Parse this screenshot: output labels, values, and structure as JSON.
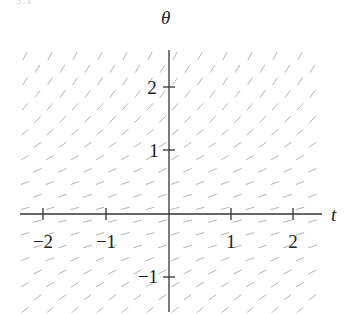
{
  "page_fragment": "3.1",
  "diagram": {
    "type": "slope_field",
    "x_axis": {
      "label": "t",
      "ticks": [
        -2,
        -1,
        1,
        2
      ],
      "tick_labels": [
        "−2",
        "−1",
        "1",
        "2"
      ],
      "range": [
        -2.35,
        2.4
      ]
    },
    "y_axis": {
      "label": "θ",
      "ticks": [
        2,
        1,
        -1
      ],
      "tick_labels": [
        "2",
        "1",
        "−1"
      ],
      "range": [
        -1.5,
        2.6
      ]
    },
    "slope_segment_color": "#b4b4b4",
    "axis_color": "#333333",
    "slope_profile": [
      {
        "theta": 2.5,
        "slope_angle_deg": 62
      },
      {
        "theta": 2.0,
        "slope_angle_deg": 55
      },
      {
        "theta": 1.5,
        "slope_angle_deg": 45
      },
      {
        "theta": 1.0,
        "slope_angle_deg": 32
      },
      {
        "theta": 0.5,
        "slope_angle_deg": 20
      },
      {
        "theta": 0.0,
        "slope_angle_deg": 14
      },
      {
        "theta": -0.5,
        "slope_angle_deg": 18
      },
      {
        "theta": -1.0,
        "slope_angle_deg": 28
      },
      {
        "theta": -1.5,
        "slope_angle_deg": 40
      }
    ]
  },
  "labels": {
    "y_axis": "θ",
    "x_axis": "t",
    "xt_m2": "−2",
    "xt_m1": "−1",
    "xt_1": "1",
    "xt_2": "2",
    "yt_2": "2",
    "yt_1": "1",
    "yt_m1": "−1"
  }
}
